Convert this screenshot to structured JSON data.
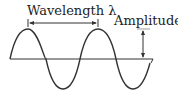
{
  "labels": {
    "wavelength": "Wavelength λ",
    "amplitude": "Amplitude"
  },
  "colors": {
    "stroke": "#333333",
    "text": "#222222"
  }
}
